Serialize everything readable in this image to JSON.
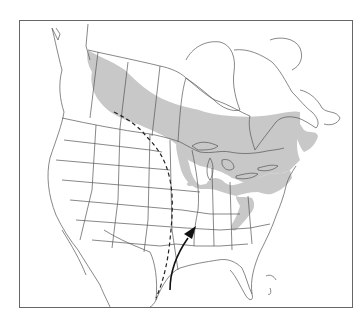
{
  "map": {
    "region": "North America",
    "colors": {
      "background": "#ffffff",
      "frame": "#555555",
      "outline": "#444444",
      "range_fill": "#c8c8c8",
      "route": "#222222"
    },
    "legend_items": [
      {
        "symbol": "gray-shaded-area",
        "meaning": "range"
      },
      {
        "symbol": "dashed-line",
        "meaning": "western boundary route"
      },
      {
        "symbol": "solid-arrow",
        "meaning": "northward migration route"
      }
    ]
  }
}
